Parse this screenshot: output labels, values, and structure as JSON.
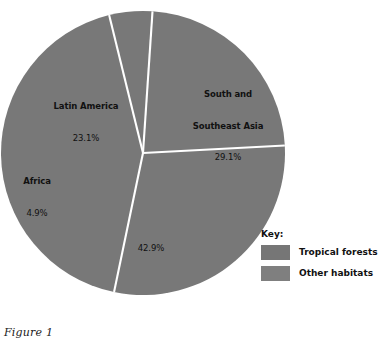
{
  "chart_data": {
    "type": "pie",
    "title": "",
    "caption": "Figure 1",
    "unit": "percent",
    "start_angle_deg": -3,
    "direction": "clockwise",
    "center": {
      "x": 143,
      "y": 153
    },
    "radius": 142,
    "slice_divider_color": "#ffffff",
    "categories": [
      "South and Southeast Asia",
      "Other habitats",
      "Africa",
      "Latin America"
    ],
    "values": [
      29.1,
      42.9,
      4.9,
      23.1
    ],
    "slices": [
      {
        "label": "South and Southeast Asia",
        "label_line1": "South and",
        "label_line2": "Southeast Asia",
        "value": 29.1,
        "value_label": "29.1%",
        "color": "#787878",
        "show_name": true
      },
      {
        "label": "Other habitats",
        "label_line1": "",
        "label_line2": "",
        "value": 42.9,
        "value_label": "42.9%",
        "color": "#787878",
        "show_name": false
      },
      {
        "label": "Africa",
        "label_line1": "Africa",
        "label_line2": "",
        "value": 4.9,
        "value_label": "4.9%",
        "color": "#787878",
        "show_name": true
      },
      {
        "label": "Latin America",
        "label_line1": "Latin America",
        "label_line2": "",
        "value": 23.1,
        "value_label": "23.1%",
        "color": "#787878",
        "show_name": true
      }
    ],
    "legend": {
      "position": "right-bottom",
      "title": "Key:",
      "entries": [
        {
          "label": "Tropical forests",
          "color": "#767676"
        },
        {
          "label": "Other habitats",
          "color": "#7f7f7f"
        }
      ]
    },
    "grid": false,
    "xlabel": "",
    "ylabel": ""
  },
  "labels": {
    "latin_america": {
      "name": "Latin America",
      "pct": "23.1%"
    },
    "asia": {
      "name_line1": "South and",
      "name_line2": "Southeast Asia",
      "pct": "29.1%"
    },
    "africa": {
      "name": "Africa",
      "pct": "4.9%"
    },
    "other": {
      "pct": "42.9%"
    }
  },
  "legend": {
    "title": "Key:",
    "tropical_forests": "Tropical forests",
    "other_habitats": "Other habitats"
  },
  "caption": {
    "text": "Figure 1"
  },
  "colors": {
    "slice_fill": "#787878",
    "divider": "#ffffff",
    "legend_swatch_tropical": "#767676",
    "legend_swatch_other": "#7f7f7f",
    "background": "#ffffff",
    "text": "#111111"
  }
}
